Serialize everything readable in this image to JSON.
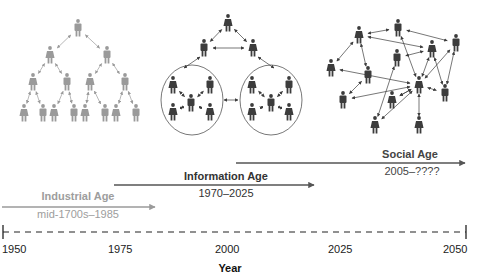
{
  "colors": {
    "industrial": "#9a9a9a",
    "industrial_text": "#9d9d9d",
    "dark": "#3c3c3c",
    "dark_text": "#333333",
    "axis": "#222222"
  },
  "ages": [
    {
      "id": "industrial",
      "title": "Industrial Age",
      "range": "mid-1700s–1985",
      "arrow": {
        "x1": 2,
        "x2": 155,
        "y": 207
      },
      "title_xy": [
        78,
        192
      ],
      "range_xy": [
        78,
        209
      ]
    },
    {
      "id": "information",
      "title": "Information Age",
      "range": "1970–2025",
      "arrow": {
        "x1": 114,
        "x2": 314,
        "y": 185
      },
      "title_xy": [
        226,
        172
      ],
      "range_xy": [
        226,
        188
      ]
    },
    {
      "id": "social",
      "title": "Social Age",
      "range": "2005–????",
      "arrow": {
        "x1": 236,
        "x2": 465,
        "y": 163
      },
      "title_xy": [
        410,
        150
      ],
      "range_xy": [
        412,
        167
      ]
    }
  ],
  "axis": {
    "title": "Year",
    "y": 232,
    "x_start": 3,
    "x_end": 466,
    "ticks": [
      {
        "label": "1950",
        "x": 3
      },
      {
        "label": "1975",
        "x": 110
      },
      {
        "label": "2000",
        "x": 217
      },
      {
        "label": "2025",
        "x": 328
      },
      {
        "label": "2050",
        "x": 443
      }
    ]
  },
  "networks": {
    "industrial": {
      "people": [
        [
          78,
          28
        ],
        [
          50,
          55
        ],
        [
          107,
          55
        ],
        [
          33,
          82
        ],
        [
          67,
          82
        ],
        [
          90,
          82
        ],
        [
          125,
          82
        ],
        [
          24,
          113
        ],
        [
          43,
          113
        ],
        [
          54,
          113
        ],
        [
          74,
          113
        ],
        [
          85,
          113
        ],
        [
          105,
          113
        ],
        [
          116,
          113
        ],
        [
          136,
          113
        ]
      ],
      "links": [
        [
          0,
          1
        ],
        [
          0,
          2
        ],
        [
          1,
          3
        ],
        [
          1,
          4
        ],
        [
          2,
          5
        ],
        [
          2,
          6
        ],
        [
          3,
          7
        ],
        [
          3,
          8
        ],
        [
          4,
          9
        ],
        [
          4,
          10
        ],
        [
          5,
          11
        ],
        [
          5,
          12
        ],
        [
          6,
          13
        ],
        [
          6,
          14
        ]
      ]
    },
    "information": {
      "people": [
        [
          228,
          23
        ],
        [
          204,
          48
        ],
        [
          253,
          48
        ],
        [
          173,
          85
        ],
        [
          210,
          85
        ],
        [
          191,
          103
        ],
        [
          173,
          112
        ],
        [
          210,
          112
        ],
        [
          252,
          85
        ],
        [
          289,
          85
        ],
        [
          271,
          103
        ],
        [
          252,
          112
        ],
        [
          289,
          112
        ]
      ],
      "links": [
        [
          0,
          1
        ],
        [
          0,
          2
        ],
        [
          1,
          2
        ],
        [
          5,
          3
        ],
        [
          5,
          4
        ],
        [
          5,
          6
        ],
        [
          5,
          7
        ],
        [
          10,
          8
        ],
        [
          10,
          9
        ],
        [
          10,
          11
        ],
        [
          10,
          12
        ]
      ],
      "circles": [
        {
          "cx": 192,
          "cy": 100,
          "rx": 31,
          "ry": 35
        },
        {
          "cx": 271,
          "cy": 100,
          "rx": 31,
          "ry": 35
        }
      ],
      "extra_links": [
        [
          200,
          57,
          184,
          68
        ],
        [
          258,
          57,
          274,
          68
        ],
        [
          224,
          100,
          238,
          100
        ]
      ]
    },
    "social": {
      "people": [
        [
          359,
          35
        ],
        [
          398,
          28
        ],
        [
          456,
          43
        ],
        [
          432,
          49
        ],
        [
          397,
          58
        ],
        [
          331,
          68
        ],
        [
          368,
          75
        ],
        [
          419,
          85
        ],
        [
          445,
          93
        ],
        [
          343,
          100
        ],
        [
          392,
          100
        ],
        [
          375,
          125
        ],
        [
          419,
          125
        ]
      ],
      "links": [
        [
          0,
          1
        ],
        [
          1,
          2
        ],
        [
          0,
          3
        ],
        [
          1,
          7
        ],
        [
          0,
          6
        ],
        [
          0,
          5
        ],
        [
          3,
          7
        ],
        [
          4,
          3
        ],
        [
          6,
          9
        ],
        [
          5,
          7
        ],
        [
          7,
          9
        ],
        [
          7,
          10
        ],
        [
          7,
          11
        ],
        [
          7,
          12
        ],
        [
          7,
          8
        ],
        [
          3,
          8
        ],
        [
          2,
          7
        ],
        [
          2,
          8
        ],
        [
          4,
          11
        ],
        [
          10,
          7
        ]
      ]
    }
  }
}
